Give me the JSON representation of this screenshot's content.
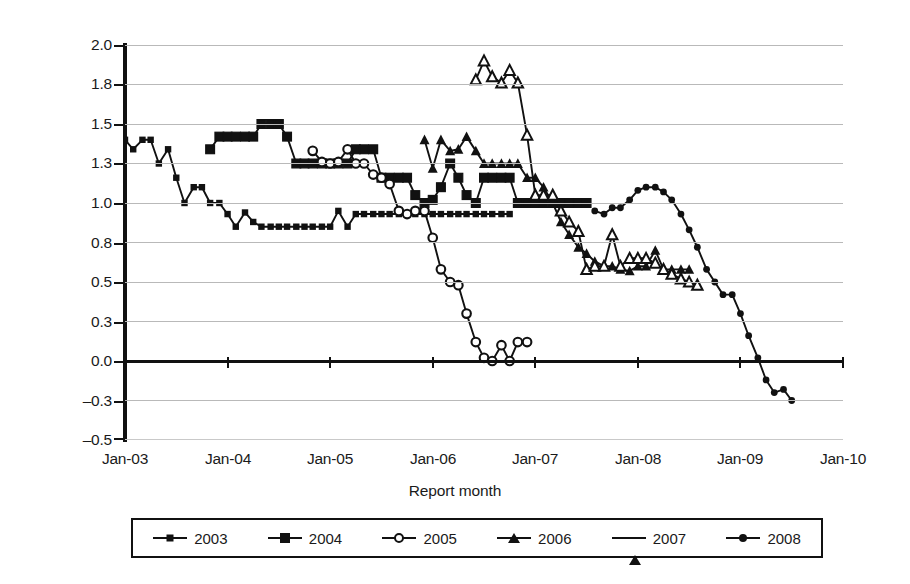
{
  "axes": {
    "y_title": "Million barrel/day",
    "x_title": "Report month",
    "y_ticks": [
      "2.0",
      "1.8",
      "1.5",
      "1.3",
      "1.0",
      "0.8",
      "0.5",
      "0.3",
      "0.0",
      "–0.3",
      "–0.5"
    ],
    "x_ticks": [
      "Jan-03",
      "Jan-04",
      "Jan-05",
      "Jan-06",
      "Jan-07",
      "Jan-08",
      "Jan-09",
      "Jan-10"
    ]
  },
  "legend": {
    "items": [
      {
        "label": "2003",
        "marker": "sq-sm"
      },
      {
        "label": "2004",
        "marker": "sq-lg"
      },
      {
        "label": "2005",
        "marker": "circ"
      },
      {
        "label": "2006",
        "marker": "tri-f"
      },
      {
        "label": "2007",
        "marker": "tri-o"
      },
      {
        "label": "2008",
        "marker": "diam"
      }
    ]
  },
  "colors": {
    "line": "#111111",
    "grid": "#b9b9b9",
    "zero_axis": "#111111",
    "background": "#ffffff"
  },
  "chart_data": {
    "type": "line",
    "title": "",
    "xlabel": "Report month",
    "ylabel": "Million barrel/day",
    "ylim": [
      -0.5,
      2.0
    ],
    "xlim": [
      2003.0,
      2010.0
    ],
    "ytick_values": [
      2.0,
      1.75,
      1.5,
      1.25,
      1.0,
      0.75,
      0.5,
      0.25,
      0.0,
      -0.25,
      -0.5
    ],
    "ytick_labels": [
      "2.0",
      "1.8",
      "1.5",
      "1.3",
      "1.0",
      "0.8",
      "0.5",
      "0.3",
      "0.0",
      "-0.3",
      "-0.5"
    ],
    "xtick_values": [
      2003,
      2004,
      2005,
      2006,
      2007,
      2008,
      2009,
      2010
    ],
    "xtick_labels": [
      "Jan-03",
      "Jan-04",
      "Jan-05",
      "Jan-06",
      "Jan-07",
      "Jan-08",
      "Jan-09",
      "Jan-10"
    ],
    "grid": true,
    "legend_position": "bottom",
    "series": [
      {
        "name": "2003",
        "marker": "small-square",
        "x": [
          2003.0,
          2003.08,
          2003.17,
          2003.25,
          2003.33,
          2003.42,
          2003.5,
          2003.58,
          2003.67,
          2003.75,
          2003.83,
          2003.92,
          2004.0,
          2004.08,
          2004.17,
          2004.25,
          2004.33,
          2004.42,
          2004.5,
          2004.58,
          2004.67,
          2004.75,
          2004.83,
          2004.92,
          2005.0,
          2005.08,
          2005.17,
          2005.25,
          2005.33,
          2005.42,
          2005.5,
          2005.58,
          2005.67,
          2005.75,
          2005.83,
          2005.92,
          2006.0,
          2006.08,
          2006.17,
          2006.25,
          2006.33,
          2006.42,
          2006.5,
          2006.58,
          2006.67,
          2006.75
        ],
        "y": [
          1.4,
          1.34,
          1.4,
          1.4,
          1.25,
          1.34,
          1.16,
          1.0,
          1.1,
          1.1,
          1.0,
          1.0,
          0.93,
          0.85,
          0.94,
          0.88,
          0.85,
          0.85,
          0.85,
          0.85,
          0.85,
          0.85,
          0.85,
          0.85,
          0.85,
          0.95,
          0.85,
          0.93,
          0.93,
          0.93,
          0.93,
          0.93,
          0.93,
          0.93,
          0.93,
          0.93,
          0.93,
          0.93,
          0.93,
          0.93,
          0.93,
          0.93,
          0.93,
          0.93,
          0.93,
          0.93
        ]
      },
      {
        "name": "2004",
        "marker": "large-square",
        "x": [
          2003.83,
          2003.92,
          2004.0,
          2004.08,
          2004.17,
          2004.25,
          2004.33,
          2004.42,
          2004.5,
          2004.58,
          2004.67,
          2004.75,
          2004.83,
          2004.92,
          2005.0,
          2005.08,
          2005.17,
          2005.25,
          2005.33,
          2005.42,
          2005.5,
          2005.58,
          2005.67,
          2005.75,
          2005.83,
          2005.92,
          2006.0,
          2006.08,
          2006.17,
          2006.25,
          2006.33,
          2006.42,
          2006.5,
          2006.58,
          2006.67,
          2006.75,
          2006.83,
          2006.92,
          2007.0,
          2007.08,
          2007.17,
          2007.25,
          2007.33,
          2007.42,
          2007.5
        ],
        "y": [
          1.34,
          1.42,
          1.42,
          1.42,
          1.42,
          1.42,
          1.5,
          1.5,
          1.5,
          1.42,
          1.25,
          1.25,
          1.25,
          1.25,
          1.25,
          1.25,
          1.25,
          1.34,
          1.34,
          1.34,
          1.16,
          1.16,
          1.16,
          1.16,
          1.05,
          1.0,
          1.02,
          1.1,
          1.25,
          1.16,
          1.05,
          1.0,
          1.16,
          1.16,
          1.16,
          1.16,
          1.0,
          1.0,
          1.0,
          1.0,
          1.0,
          1.0,
          1.0,
          1.0,
          1.0
        ]
      },
      {
        "name": "2005",
        "marker": "open-circle",
        "x": [
          2004.83,
          2004.92,
          2005.0,
          2005.08,
          2005.17,
          2005.25,
          2005.33,
          2005.42,
          2005.5,
          2005.58,
          2005.67,
          2005.75,
          2005.83,
          2005.92,
          2006.0,
          2006.08,
          2006.17,
          2006.25,
          2006.33,
          2006.42,
          2006.5,
          2006.58,
          2006.67,
          2006.75,
          2006.83,
          2006.92
        ],
        "y": [
          1.33,
          1.26,
          1.25,
          1.26,
          1.34,
          1.25,
          1.25,
          1.18,
          1.16,
          1.12,
          0.95,
          0.93,
          0.95,
          0.95,
          0.78,
          0.58,
          0.5,
          0.48,
          0.3,
          0.12,
          0.02,
          0.0,
          0.1,
          0.0,
          0.12,
          0.12
        ]
      },
      {
        "name": "2006",
        "marker": "filled-triangle",
        "x": [
          2005.92,
          2006.0,
          2006.08,
          2006.17,
          2006.25,
          2006.33,
          2006.42,
          2006.5,
          2006.58,
          2006.67,
          2006.75,
          2006.83,
          2006.92,
          2007.0,
          2007.08,
          2007.17,
          2007.25,
          2007.33,
          2007.42,
          2007.5,
          2007.58,
          2007.67,
          2007.75,
          2007.83,
          2007.92,
          2008.0,
          2008.08,
          2008.17,
          2008.25,
          2008.33,
          2008.42,
          2008.5
        ],
        "y": [
          1.4,
          1.22,
          1.4,
          1.33,
          1.34,
          1.42,
          1.33,
          1.25,
          1.25,
          1.25,
          1.25,
          1.25,
          1.16,
          1.16,
          1.1,
          1.0,
          0.88,
          0.8,
          0.72,
          0.68,
          0.63,
          0.6,
          0.6,
          0.58,
          0.57,
          0.6,
          0.6,
          0.7,
          0.58,
          0.58,
          0.58,
          0.58
        ]
      },
      {
        "name": "2007",
        "marker": "open-triangle",
        "x": [
          2006.42,
          2006.5,
          2006.58,
          2006.67,
          2006.75,
          2006.83,
          2006.92,
          2007.0,
          2007.08,
          2007.17,
          2007.25,
          2007.33,
          2007.42,
          2007.5,
          2007.58,
          2007.67,
          2007.75,
          2007.83,
          2007.92,
          2008.0,
          2008.08,
          2008.17,
          2008.25,
          2008.33,
          2008.42,
          2008.5,
          2008.58
        ],
        "y": [
          1.78,
          1.9,
          1.8,
          1.76,
          1.84,
          1.76,
          1.43,
          1.05,
          1.05,
          1.05,
          0.95,
          0.88,
          0.82,
          0.58,
          0.6,
          0.6,
          0.8,
          0.6,
          0.65,
          0.65,
          0.65,
          0.62,
          0.58,
          0.55,
          0.52,
          0.5,
          0.48
        ]
      },
      {
        "name": "2008",
        "marker": "filled-diamond",
        "x": [
          2007.58,
          2007.67,
          2007.75,
          2007.83,
          2007.92,
          2008.0,
          2008.08,
          2008.17,
          2008.25,
          2008.33,
          2008.42,
          2008.5,
          2008.58,
          2008.67,
          2008.75,
          2008.83,
          2008.92,
          2009.0,
          2009.08,
          2009.17,
          2009.25,
          2009.33,
          2009.42,
          2009.5
        ],
        "y": [
          0.95,
          0.93,
          0.97,
          0.97,
          1.02,
          1.08,
          1.1,
          1.1,
          1.07,
          1.02,
          0.93,
          0.83,
          0.72,
          0.58,
          0.5,
          0.42,
          0.42,
          0.3,
          0.16,
          0.02,
          -0.12,
          -0.2,
          -0.18,
          -0.25
        ]
      }
    ]
  }
}
